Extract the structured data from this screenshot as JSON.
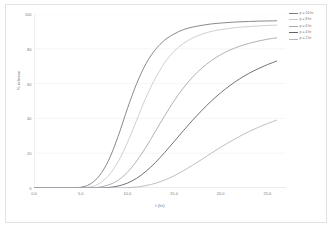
{
  "chart_data": {
    "type": "line",
    "title": "",
    "xlabel": "t (hr)",
    "ylabel": "% release",
    "xlim": [
      0.0,
      27.0
    ],
    "ylim": [
      0,
      100
    ],
    "grid": true,
    "legend_position": "top-right",
    "xticks": [
      "0.0",
      "5.0",
      "10.0",
      "15.0",
      "20.0",
      "25.0"
    ],
    "xtick_values": [
      0.0,
      5.0,
      10.0,
      15.0,
      20.0,
      25.0
    ],
    "yticks": [
      "0",
      "20",
      "40",
      "60",
      "80",
      "100"
    ],
    "ytick_values": [
      0,
      20,
      40,
      60,
      80,
      100
    ],
    "x": [
      0,
      1,
      2,
      3,
      4,
      5,
      6,
      7,
      8,
      9,
      10,
      11,
      12,
      13,
      14,
      15,
      16,
      17,
      18,
      19,
      20,
      21,
      22,
      23,
      24,
      25,
      26
    ],
    "series": [
      {
        "name": "p = 10 hr",
        "color": "#7c7c84",
        "values": [
          0,
          0,
          0,
          0,
          0,
          0.4,
          2.2,
          7.0,
          16.0,
          29.5,
          45.5,
          60.0,
          71.5,
          79.5,
          85.0,
          88.5,
          91.0,
          92.5,
          93.5,
          94.3,
          94.8,
          95.2,
          95.5,
          95.7,
          95.9,
          96.0,
          96.1
        ]
      },
      {
        "name": "p = 8 hr",
        "color": "#c9c9cf",
        "values": [
          0,
          0,
          0,
          0,
          0,
          0,
          0.6,
          2.6,
          7.2,
          15.0,
          26.0,
          39.0,
          52.0,
          63.0,
          72.0,
          78.5,
          83.0,
          86.2,
          88.4,
          90.0,
          91.0,
          91.8,
          92.4,
          92.8,
          93.1,
          93.4,
          93.6
        ]
      },
      {
        "name": "p = 6 hr",
        "color": "#a8a8b0",
        "values": [
          0,
          0,
          0,
          0,
          0,
          0,
          0,
          0.5,
          1.8,
          4.4,
          9.0,
          15.5,
          23.5,
          32.5,
          41.5,
          50.0,
          57.5,
          63.8,
          69.0,
          73.2,
          76.6,
          79.3,
          81.4,
          83.1,
          84.4,
          85.5,
          86.3
        ]
      },
      {
        "name": "p = 4 hr",
        "color": "#62626b",
        "values": [
          0,
          0,
          0,
          0,
          0,
          0,
          0,
          0,
          0.3,
          1.1,
          2.8,
          5.6,
          9.6,
          14.6,
          20.4,
          26.6,
          32.9,
          39.0,
          44.7,
          50.0,
          54.7,
          58.9,
          62.6,
          65.8,
          68.5,
          70.9,
          72.9
        ]
      },
      {
        "name": "p = 2 hr",
        "color": "#b7b7be",
        "values": [
          0,
          0,
          0,
          0,
          0,
          0,
          0,
          0,
          0,
          0,
          0.2,
          0.6,
          1.4,
          2.7,
          4.6,
          7.0,
          9.9,
          13.1,
          16.5,
          20.0,
          23.4,
          26.6,
          29.6,
          32.3,
          34.8,
          37.0,
          39.0
        ]
      }
    ]
  },
  "axis": {
    "line_color": "#d0d0d0",
    "grid_color": "#ededed",
    "tick_color": "#7a7a7a"
  }
}
